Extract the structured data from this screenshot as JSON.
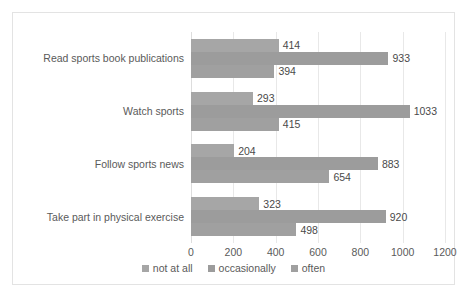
{
  "chart_data": {
    "type": "bar",
    "orientation": "horizontal",
    "title": "",
    "subtitle": "",
    "xlabel": "",
    "ylabel": "",
    "xlim": [
      0,
      1200
    ],
    "xticks": [
      0,
      200,
      400,
      600,
      800,
      1000,
      1200
    ],
    "tick_labels": [
      "0",
      "200",
      "400",
      "600",
      "800",
      "1000",
      "1200"
    ],
    "grid": true,
    "grid_axis": "x",
    "legend_position": "bottom",
    "categories": [
      "Read sports book publications",
      "Watch sports",
      "Follow sports news",
      "Take part in physical exercise"
    ],
    "series": [
      {
        "name": "not at all",
        "color": "#a6a6a6",
        "values": [
          414,
          293,
          204,
          323
        ],
        "labels": [
          "414",
          "293",
          "204",
          "323"
        ]
      },
      {
        "name": "occasionally",
        "color": "#9c9c9c",
        "values": [
          933,
          1033,
          883,
          920
        ],
        "labels": [
          "933",
          "1033",
          "883",
          "920"
        ]
      },
      {
        "name": "often",
        "color": "#a0a0a0",
        "values": [
          394,
          415,
          654,
          498
        ],
        "labels": [
          "394",
          "415",
          "654",
          "498"
        ]
      }
    ]
  },
  "colors": {
    "background": "#ffffff",
    "frame_border": "#e3e3e3",
    "gridline": "#e8e8e8",
    "text": "#5a5a5a",
    "label_text": "#4a4a4a"
  }
}
